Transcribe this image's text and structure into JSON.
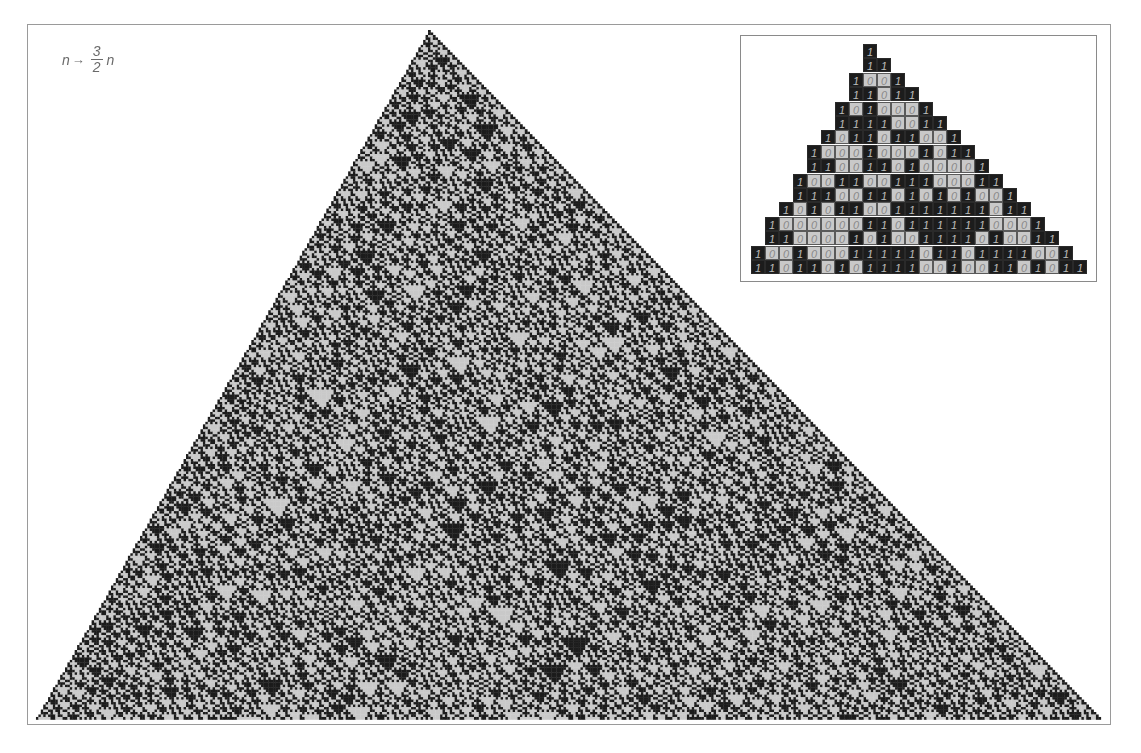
{
  "figure": {
    "title_formula": {
      "lhs": "n",
      "arrow": "→",
      "numerator": "3",
      "denominator": "2",
      "rhs": "n"
    },
    "colors": {
      "one_cell": "#1c1c1c",
      "zero_cell": "#c9c9c9",
      "frame": "#9a9a9a",
      "text": "#6a6a6a"
    },
    "main_pattern": {
      "description": "Base-2 digits of successive powers of 3 (n -> 3/2 n), each row aligned so the rightmost digit shifts one cell right per step",
      "base": 2,
      "multiplier_numerator": 3,
      "multiplier_denominator": 2,
      "row_count": 278
    },
    "inset": {
      "rows": [
        "1",
        "11",
        "1001",
        "11011",
        "1010001",
        "11110011",
        "1011011001",
        "100010001011",
        "1100110100001",
        "100110011100011",
        "1110011010101001",
        "101011001111111011",
        "10000001101111110001",
        "110000101001111010011",
        "10010001111101101111001",
        "110110101111001001101011"
      ]
    }
  }
}
